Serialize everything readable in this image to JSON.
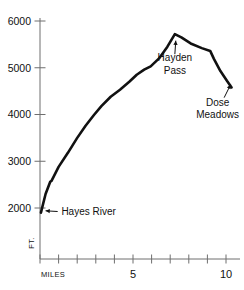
{
  "chart_data": {
    "type": "line",
    "title": "",
    "subtitle": "",
    "xlabel": "MILES",
    "ylabel": "FT.",
    "xlim": [
      0,
      10.6
    ],
    "ylim": [
      1550,
      6150
    ],
    "grid": false,
    "legend": null,
    "x_ticks_major": [
      5,
      10
    ],
    "x_tick_labels": [
      "5",
      "10"
    ],
    "x_ticks_minor": [
      0,
      1,
      2,
      3,
      4,
      5,
      6,
      7,
      8,
      9,
      10
    ],
    "y_ticks": [
      2000,
      3000,
      4000,
      5000,
      6000
    ],
    "y_tick_labels": [
      "2000",
      "3000",
      "4000",
      "5000",
      "6000"
    ],
    "series": [
      {
        "name": "Elevation profile",
        "color": "#111111",
        "x": [
          0.05,
          0.3,
          0.55,
          0.62,
          1.0,
          1.5,
          2.0,
          2.45,
          2.9,
          3.3,
          3.8,
          4.3,
          4.8,
          5.2,
          5.6,
          5.95,
          6.4,
          6.85,
          7.25,
          7.6,
          8.1,
          8.7,
          9.15,
          9.35,
          9.7,
          10.05,
          10.3
        ],
        "y": [
          1900,
          2300,
          2560,
          2580,
          2880,
          3180,
          3500,
          3760,
          3990,
          4180,
          4380,
          4530,
          4700,
          4850,
          4960,
          5030,
          5200,
          5450,
          5720,
          5650,
          5520,
          5420,
          5360,
          5190,
          4930,
          4720,
          4580
        ]
      }
    ],
    "annotations": [
      {
        "name": "hayes-river",
        "text": "Hayes River",
        "text_x": 1.15,
        "text_y": 1925,
        "anchor": "start",
        "arrow_from_x": 0.95,
        "arrow_from_y": 1925,
        "arrow_to_x": 0.3,
        "arrow_to_y": 1940
      },
      {
        "name": "hayden-pass",
        "line1": "Hayden",
        "line2": "Pass",
        "text_x": 7.25,
        "text_y1": 5210,
        "text_y2": 4940,
        "anchor": "middle",
        "arrow_from_x": 7.25,
        "arrow_from_y": 5290,
        "arrow_to_x": 7.3,
        "arrow_to_y": 5580
      },
      {
        "name": "dose-meadows",
        "line1": "Dose",
        "line2": "Meadows",
        "text_x": 9.55,
        "text_y1": 4260,
        "text_y2": 3990,
        "anchor": "middle",
        "arrow_from_x": 9.9,
        "arrow_from_y": 4360,
        "arrow_to_x": 10.25,
        "arrow_to_y": 4640
      }
    ],
    "axis_color": "#6e6e6e",
    "line_color": "#111111",
    "background": "#ffffff"
  }
}
